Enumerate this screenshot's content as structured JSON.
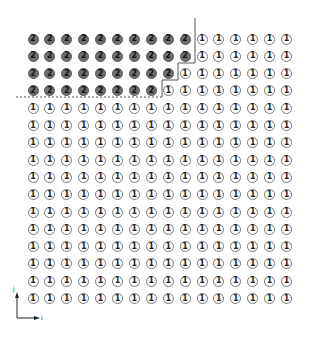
{
  "diagram": {
    "type": "grid-partition",
    "rows": 16,
    "cols": 16,
    "label_region_a": "2",
    "label_region_b": "1",
    "region_a_row_counts": [
      10,
      10,
      9,
      8,
      0,
      0,
      0,
      0,
      0,
      0,
      0,
      0,
      0,
      0,
      0,
      0
    ],
    "grid_origin": {
      "x": 33,
      "y": 39
    },
    "spacing": {
      "x": 16.9,
      "y": 17.3
    },
    "colors": {
      "region_a_fill": "#6f6f6f",
      "region_b_fill": "#ffffff",
      "outline": "#777777",
      "boundary_line": "#555555"
    },
    "boundary": {
      "solid_path": [
        [
          195,
          18
        ],
        [
          195,
          63
        ],
        [
          178,
          63
        ],
        [
          178,
          80
        ],
        [
          162,
          80
        ],
        [
          162,
          97
        ]
      ],
      "dashed_path": [
        [
          162,
          97
        ],
        [
          15,
          97
        ]
      ]
    },
    "axes": {
      "x_label": "i",
      "y_label": "j"
    }
  }
}
